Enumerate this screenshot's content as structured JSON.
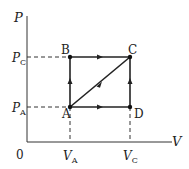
{
  "diagram": {
    "type": "PV diagram",
    "axes": {
      "y_label": "P",
      "x_label": "V",
      "origin_label": "0"
    },
    "y_ticks": [
      {
        "base": "P",
        "sub": "C"
      },
      {
        "base": "P",
        "sub": "A"
      }
    ],
    "x_ticks": [
      {
        "base": "V",
        "sub": "A"
      },
      {
        "base": "V",
        "sub": "C"
      }
    ],
    "points": {
      "A": "A",
      "B": "B",
      "C": "C",
      "D": "D"
    },
    "paths": [
      {
        "from": "A",
        "to": "B",
        "direction": "up"
      },
      {
        "from": "B",
        "to": "C",
        "direction": "right"
      },
      {
        "from": "A",
        "to": "C",
        "direction": "diagonal"
      },
      {
        "from": "A",
        "to": "D",
        "direction": "right"
      },
      {
        "from": "D",
        "to": "C",
        "direction": "up"
      }
    ]
  }
}
